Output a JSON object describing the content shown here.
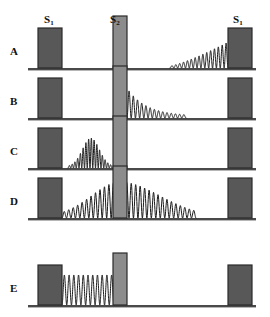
{
  "figure": {
    "title_labels": [
      {
        "text": "S",
        "sub": "1",
        "x": 44,
        "y": 14
      },
      {
        "text": "S",
        "sub": "2",
        "x": 110,
        "y": 14
      },
      {
        "text": "S",
        "sub": "1",
        "x": 233,
        "y": 14
      }
    ],
    "row_labels": [
      "A",
      "B",
      "C",
      "D",
      "E"
    ],
    "colors": {
      "bar_dark_fill": "#585858",
      "bar_light_fill": "#8c8c8c",
      "bar_stroke": "#2b2b2b",
      "baseline": "#4a4a4a",
      "wave": "#1a1a1a",
      "background": "#ffffff",
      "text": "#111111"
    },
    "geometry": {
      "baseline_x_start": 28,
      "baseline_x_end": 256,
      "bar1_x": 38,
      "bar1_width": 24,
      "bar2_x": 113,
      "bar2_width": 14,
      "bar3_x": 228,
      "bar3_width": 24,
      "bar_dark_height": 40,
      "bar_light_height": 52,
      "row_baselines": [
        68,
        118,
        168,
        218,
        305
      ]
    }
  },
  "chart_data": {
    "type": "line",
    "title": "",
    "xlabel": "",
    "ylabel": "",
    "legend": [],
    "annotations": [
      "S1",
      "S2",
      "S1",
      "A",
      "B",
      "C",
      "D",
      "E"
    ],
    "series": [
      {
        "name": "A",
        "row": 0,
        "baseline_y": 68,
        "description": "growing-amplitude oscillation approaching right S1 barrier",
        "x_start": 170,
        "x_end": 228,
        "cycles": 15,
        "amp_start": 2,
        "amp_end": 26,
        "envelope": "linear-growth"
      },
      {
        "name": "B",
        "row": 1,
        "baseline_y": 118,
        "description": "decaying oscillation emitted rightward from S2 barrier",
        "x_start": 127,
        "x_end": 186,
        "cycles": 14,
        "amp_start": 30,
        "amp_end": 2,
        "envelope": "exponential-decay"
      },
      {
        "name": "C",
        "row": 2,
        "baseline_y": 168,
        "description": "wave packet with rise-and-fall envelope between S1 and S2",
        "x_start": 68,
        "x_end": 112,
        "cycles": 16,
        "amp_start": 2,
        "amp_peak": 30,
        "amp_end": 2,
        "envelope": "gaussian-packet"
      },
      {
        "name": "D",
        "row": 3,
        "baseline_y": 218,
        "description": "wave peaking at S2 barrier, decaying to both left and right",
        "x_start": 62,
        "x_end": 196,
        "cycles": 30,
        "amp_start": 2,
        "amp_peak": 36,
        "amp_end": 2,
        "envelope": "two-sided-decay",
        "peak_x": 120
      },
      {
        "name": "E",
        "row": 4,
        "baseline_y": 305,
        "description": "constant-amplitude standing wave between S1 and S2",
        "x_start": 62,
        "x_end": 114,
        "cycles": 11,
        "amp_start": 30,
        "amp_end": 30,
        "envelope": "constant"
      }
    ]
  }
}
